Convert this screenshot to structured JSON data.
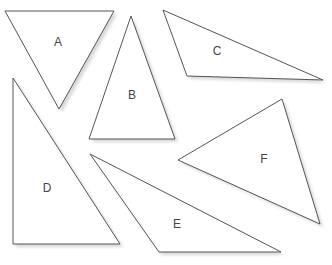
{
  "triangles": [
    {
      "label": "A",
      "points": [
        [
          5,
          11
        ],
        [
          114,
          11
        ],
        [
          59,
          109
        ]
      ],
      "label_pos": [
        58,
        43
      ]
    },
    {
      "label": "B",
      "points": [
        [
          131,
          16
        ],
        [
          89,
          139
        ],
        [
          175,
          139
        ]
      ],
      "label_pos": [
        132,
        96
      ]
    },
    {
      "label": "C",
      "points": [
        [
          163,
          10
        ],
        [
          187,
          76
        ],
        [
          323,
          80
        ]
      ],
      "label_pos": [
        217,
        52
      ]
    },
    {
      "label": "D",
      "points": [
        [
          13,
          78
        ],
        [
          13,
          244
        ],
        [
          120,
          244
        ]
      ],
      "label_pos": [
        47,
        189
      ]
    },
    {
      "label": "E",
      "points": [
        [
          90,
          154
        ],
        [
          159,
          252
        ],
        [
          281,
          252
        ]
      ],
      "label_pos": [
        177,
        225
      ]
    },
    {
      "label": "F",
      "points": [
        [
          178,
          160
        ],
        [
          282,
          99
        ],
        [
          320,
          224
        ]
      ],
      "label_pos": [
        264,
        160
      ]
    }
  ]
}
